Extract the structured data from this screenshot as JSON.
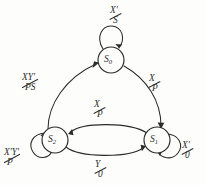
{
  "diagram": {
    "type": "mealy-state-machine",
    "colors": {
      "background": "#fdfdfc",
      "stroke": "#2b2b2b",
      "text": "#2d2d2d"
    },
    "states": [
      {
        "id": "S0",
        "name": "S",
        "subscript": "0",
        "cx": 111,
        "cy": 60,
        "r": 13
      },
      {
        "id": "S1",
        "name": "S",
        "subscript": "1",
        "cx": 157,
        "cy": 140,
        "r": 13
      },
      {
        "id": "S2",
        "name": "S",
        "subscript": "2",
        "cx": 55,
        "cy": 140,
        "r": 13
      }
    ],
    "self_loops": [
      {
        "id": "loop-s0",
        "state": "S0",
        "input": "X'",
        "output": "S",
        "label": "X'/S"
      },
      {
        "id": "loop-s1",
        "state": "S1",
        "input": "X'",
        "output": "0",
        "label": "X'/0"
      },
      {
        "id": "loop-s2",
        "state": "S2",
        "input": "X'Y'",
        "output": "P",
        "label": "X'Y'/P"
      }
    ],
    "transitions": [
      {
        "id": "t-s2-s0",
        "from": "S2",
        "to": "S0",
        "input": "XY'",
        "output": "PS",
        "label": "XY'/PS"
      },
      {
        "id": "t-s0-s1",
        "from": "S0",
        "to": "S1",
        "input": "X",
        "output": "P",
        "label": "X/P"
      },
      {
        "id": "t-s1-s2",
        "from": "S1",
        "to": "S2",
        "input": "X",
        "output": "P",
        "label": "X/P"
      },
      {
        "id": "t-s2-s1",
        "from": "S2",
        "to": "S1",
        "input": "Y",
        "output": "0",
        "label": "Y/0"
      }
    ],
    "labels": {
      "loop_s0_num": "X'",
      "loop_s0_den": "S",
      "loop_s1_num": "X'",
      "loop_s1_den": "0",
      "loop_s2_num": "X'Y'",
      "loop_s2_den": "P",
      "t_s2_s0_num": "XY'",
      "t_s2_s0_den": "PS",
      "t_s0_s1_num": "X",
      "t_s0_s1_den": "P",
      "t_s1_s2_num": "X",
      "t_s1_s2_den": "P",
      "t_s2_s1_num": "Y",
      "t_s2_s1_den": "0"
    },
    "state_names": {
      "s0_name": "S",
      "s0_sub": "0",
      "s1_name": "S",
      "s1_sub": "1",
      "s2_name": "S",
      "s2_sub": "2"
    }
  }
}
